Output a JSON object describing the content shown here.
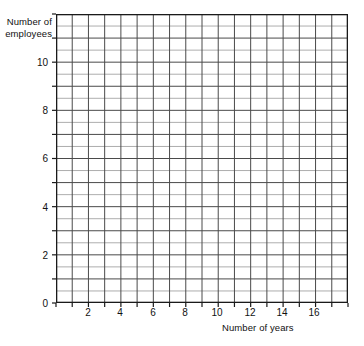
{
  "chart_data": {
    "type": "scatter",
    "title": "",
    "subtitle": "",
    "xlabel": "Number of years",
    "ylabel": "Number of employees",
    "xlim": [
      0,
      18
    ],
    "ylim": [
      0,
      12
    ],
    "x_major_ticks": [
      2,
      4,
      6,
      8,
      10,
      12,
      14,
      16
    ],
    "x_tick_labels": [
      "2",
      "4",
      "6",
      "8",
      "10",
      "12",
      "14",
      "16"
    ],
    "y_major_ticks": [
      0,
      2,
      4,
      6,
      8,
      10
    ],
    "y_tick_labels": [
      "0",
      "2",
      "4",
      "6",
      "8",
      "10"
    ],
    "x_gridline_step": 1,
    "y_gridline_step": 0.5,
    "x_gridline_count": 18,
    "y_gridline_count": 24,
    "grid": true,
    "legend": null,
    "series": [
      {
        "name": "",
        "x": [],
        "y": []
      }
    ],
    "annotations": [],
    "note": "Blank grid / graph paper with no plotted data points",
    "colors": {
      "background": "#ffffff",
      "grid_line": "#6e6e6e",
      "axis_line": "#1a1a1a",
      "text": "#111111"
    }
  },
  "axes": {
    "y_title": "Number of\nemployees",
    "x_title": "Number of years"
  },
  "y_ticks": [
    {
      "value": 10,
      "label": "10",
      "top": 57
    },
    {
      "value": 8,
      "label": "8",
      "top": 105
    },
    {
      "value": 6,
      "label": "6",
      "top": 153
    },
    {
      "value": 4,
      "label": "4",
      "top": 202
    },
    {
      "value": 2,
      "label": "2",
      "top": 250
    },
    {
      "value": 0,
      "label": "0",
      "top": 298
    }
  ],
  "x_ticks": [
    {
      "value": 2,
      "label": "2",
      "left": 78
    },
    {
      "value": 4,
      "label": "4",
      "left": 110
    },
    {
      "value": 6,
      "label": "6",
      "left": 143
    },
    {
      "value": 8,
      "label": "8",
      "left": 175
    },
    {
      "value": 10,
      "label": "10",
      "left": 207
    },
    {
      "value": 12,
      "label": "12",
      "left": 240
    },
    {
      "value": 14,
      "label": "14",
      "left": 272
    },
    {
      "value": 16,
      "label": "16",
      "left": 304
    }
  ]
}
